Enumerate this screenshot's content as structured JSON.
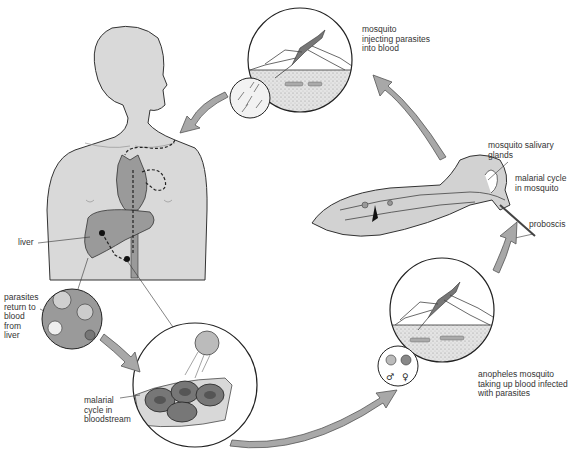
{
  "diagram": {
    "title": "",
    "labels": {
      "mosquito_injecting": [
        "mosquito",
        "injecting parasites",
        "into blood"
      ],
      "salivary_glands": [
        "mosquito salivary",
        "glands"
      ],
      "cycle_in_mosquito": [
        "malarial cycle",
        "in mosquito"
      ],
      "proboscis": [
        "proboscis"
      ],
      "liver": [
        "liver"
      ],
      "parasites_return": [
        "parasites",
        "return to",
        "blood",
        "from",
        "liver"
      ],
      "cycle_in_bloodstream": [
        "malarial",
        "cycle in",
        "bloodstream"
      ],
      "anopheles_taking_blood": [
        "anopheles mosquito",
        "taking up blood infected",
        "with parasites"
      ]
    },
    "gametocyte_symbols": {
      "male": "♂",
      "female": "♀"
    },
    "stages": [
      "mosquito injecting parasites into blood",
      "liver",
      "parasites return to blood from liver",
      "malarial cycle in bloodstream",
      "anopheles mosquito taking up blood infected with parasites",
      "malarial cycle in mosquito"
    ],
    "colors": {
      "body_fill": "#d9d9d9",
      "organ_fill": "#9a9a9a",
      "outline": "#333333",
      "arrow_fill": "#a8a8a8",
      "background": "#ffffff"
    }
  }
}
